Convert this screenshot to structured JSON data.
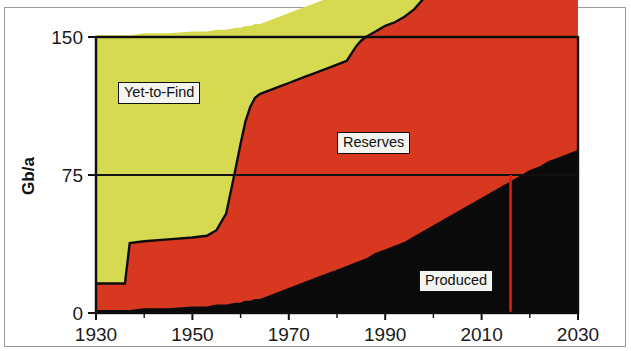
{
  "figure": {
    "title": "",
    "y_axis_label": "Gb/a"
  },
  "labels": {
    "yet_to_find": "Yet-to-Find",
    "reserves": "Reserves",
    "produced": "Produced"
  },
  "colors": {
    "yet_to_find": "#d6da50",
    "reserves": "#d93820",
    "produced": "#0a0a0a",
    "marker_line": "#e01b10",
    "axis": "#111111",
    "background": "#ffffff"
  },
  "axes": {
    "x_ticks": [
      "1930",
      "1950",
      "1970",
      "1990",
      "2010",
      "2030"
    ],
    "x_tick_values": [
      1930,
      1950,
      1970,
      1990,
      2010,
      2030
    ],
    "x_minor_step": 10,
    "y_ticks": [
      "0",
      "75",
      "150"
    ],
    "y_tick_values": [
      0,
      75,
      150
    ],
    "xlim": [
      1930,
      2030
    ],
    "ylim": [
      0,
      150
    ]
  },
  "marker": {
    "name": "present-year-line",
    "value": 2016
  },
  "chart_data": {
    "type": "area",
    "title": "",
    "subtitle": "",
    "xlabel": "",
    "ylabel": "Gb/a",
    "xlim": [
      1930,
      2030
    ],
    "ylim": [
      0,
      150
    ],
    "grid": false,
    "legend": "inline-callouts",
    "stacked": true,
    "stack_order": [
      "Produced",
      "Reserves",
      "Yet-to-Find"
    ],
    "annotations": [
      {
        "text": "Yet-to-Find",
        "x": 1945,
        "y": 112
      },
      {
        "text": "Reserves",
        "x": 1981,
        "y": 93
      },
      {
        "text": "Produced",
        "x": 2000,
        "y": 27
      },
      {
        "text": "",
        "x": 2016,
        "y": 0,
        "kind": "vertical-line",
        "color": "#e01b10"
      }
    ],
    "x": [
      1930,
      1934,
      1936,
      1937,
      1940,
      1945,
      1950,
      1953,
      1955,
      1957,
      1959,
      1960,
      1961,
      1962,
      1963,
      1964,
      1965,
      1966,
      1968,
      1970,
      1973,
      1975,
      1978,
      1980,
      1982,
      1984,
      1985,
      1986,
      1988,
      1990,
      1992,
      1994,
      1996,
      1998,
      2000,
      2002,
      2004,
      2006,
      2008,
      2010,
      2014,
      2016,
      2018,
      2020,
      2022,
      2024,
      2026,
      2028,
      2030
    ],
    "series": [
      {
        "name": "Produced",
        "description": "Cumulative oil produced",
        "values": [
          1,
          1,
          1,
          1,
          2,
          2,
          3,
          3,
          4,
          4,
          5,
          5,
          6,
          6,
          7,
          7,
          8,
          9,
          11,
          13,
          16,
          18,
          21,
          23,
          25,
          27,
          28,
          29,
          32,
          34,
          36,
          38,
          41,
          44,
          47,
          50,
          53,
          56,
          59,
          62,
          68,
          71,
          74,
          77,
          79,
          82,
          84,
          86,
          88
        ]
      },
      {
        "name": "Reserves",
        "description": "Discovered but not yet produced",
        "values": [
          15,
          15,
          15,
          37,
          37,
          38,
          38,
          39,
          41,
          50,
          74,
          87,
          98,
          106,
          110,
          112,
          112,
          112,
          112,
          112,
          112,
          112,
          112,
          112,
          112,
          118,
          120,
          121,
          121,
          122,
          122,
          123,
          124,
          127,
          131,
          132,
          133,
          134,
          136,
          137,
          140,
          142,
          143,
          145,
          146,
          147,
          148,
          149,
          150
        ]
      },
      {
        "name": "Yet-to-Find",
        "description": "Undiscovered oil remaining to be found",
        "values": [
          135,
          135,
          135,
          113,
          113,
          112,
          112,
          111,
          109,
          100,
          76,
          63,
          52,
          44,
          40,
          38,
          38,
          38,
          38,
          38,
          38,
          38,
          38,
          38,
          38,
          32,
          30,
          29,
          29,
          28,
          28,
          27,
          26,
          23,
          19,
          18,
          17,
          16,
          14,
          13,
          10,
          8,
          7,
          5,
          4,
          3,
          2,
          1,
          0
        ]
      }
    ]
  }
}
